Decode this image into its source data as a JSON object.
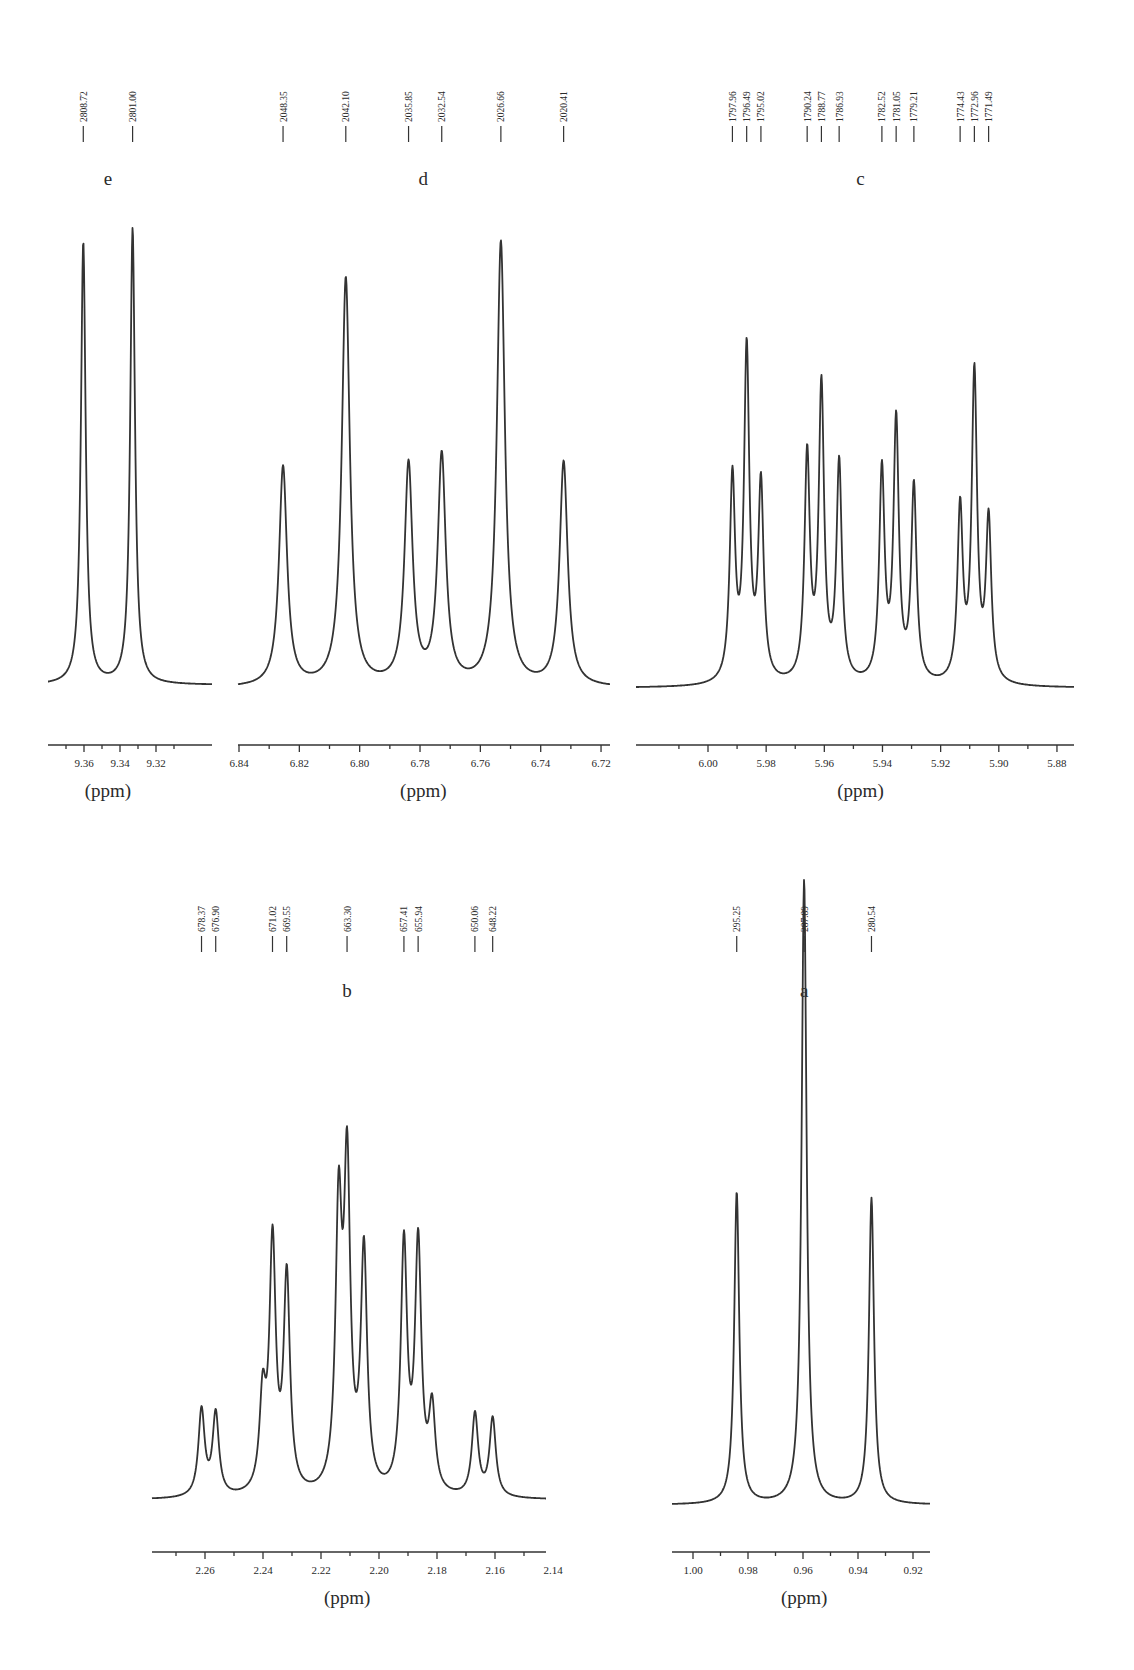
{
  "chart_data": [
    {
      "id": "e",
      "type": "line",
      "title": "e",
      "xlabel": "(ppm)",
      "ylabel": "",
      "xlim": [
        9.372,
        9.308
      ],
      "x_ticks_major": [
        9.36,
        9.34,
        9.32
      ],
      "tick_labels": [
        "9.36",
        "9.34",
        "9.32"
      ],
      "minor_tick_step": 0.01,
      "grid": false,
      "peak_labels_hz": [
        "2808.72",
        "2801.00"
      ],
      "peaks": [
        {
          "ppm": 9.3604,
          "rel_height": 0.97
        },
        {
          "ppm": 9.333,
          "rel_height": 1.0
        }
      ],
      "linewidth_ppm": 0.0032,
      "layout": {
        "x0": 48,
        "x1": 212,
        "axis_y": 745,
        "base_y": 685,
        "top_y": 228,
        "px_per_ppm": 1800,
        "ref_ppm": 9.36,
        "ref_px": 84,
        "label_y": 185,
        "marks_y": [
          60,
          128
        ]
      }
    },
    {
      "id": "d",
      "type": "line",
      "title": "d",
      "xlabel": "(ppm)",
      "ylabel": "",
      "xlim": [
        6.845,
        6.716
      ],
      "x_ticks_major": [
        6.84,
        6.82,
        6.8,
        6.78,
        6.76,
        6.74,
        6.72
      ],
      "tick_labels": [
        "6.84",
        "6.82",
        "6.80",
        "6.78",
        "6.76",
        "6.74",
        "6.72"
      ],
      "minor_tick_step": 0.01,
      "grid": false,
      "peak_labels_hz": [
        "2048.35",
        "2042.10",
        "2035.85",
        "2032.54",
        "2026.66",
        "2020.41"
      ],
      "peaks": [
        {
          "ppm": 6.8254,
          "rel_height": 0.49
        },
        {
          "ppm": 6.8046,
          "rel_height": 0.91
        },
        {
          "ppm": 6.7838,
          "rel_height": 0.49
        },
        {
          "ppm": 6.7728,
          "rel_height": 0.51
        },
        {
          "ppm": 6.7532,
          "rel_height": 0.99
        },
        {
          "ppm": 6.7324,
          "rel_height": 0.5
        }
      ],
      "linewidth_ppm": 0.0032,
      "layout": {
        "x0": 238,
        "x1": 610,
        "axis_y": 745,
        "base_y": 688,
        "top_y": 236,
        "px_per_ppm": 3017,
        "ref_ppm": 6.84,
        "ref_px": 239,
        "label_y": 185,
        "marks_y": [
          60,
          128
        ]
      }
    },
    {
      "id": "c",
      "type": "line",
      "title": "c",
      "xlabel": "(ppm)",
      "ylabel": "",
      "xlim": [
        6.012,
        5.873
      ],
      "x_ticks_major": [
        6.0,
        5.98,
        5.96,
        5.94,
        5.92,
        5.9,
        5.88
      ],
      "tick_labels": [
        "6.00",
        "5.98",
        "5.96",
        "5.94",
        "5.92",
        "5.90",
        "5.88"
      ],
      "minor_tick_step": 0.01,
      "grid": false,
      "peak_labels_hz": [
        "1797.96",
        "1796.49",
        "1795.02",
        "1790.24",
        "1788.77",
        "1786.93",
        "1782.52",
        "1781.05",
        "1779.21",
        "1774.43",
        "1772.96",
        "1771.49"
      ],
      "peaks": [
        {
          "ppm": 5.9916,
          "rel_height": 0.54
        },
        {
          "ppm": 5.9867,
          "rel_height": 0.88
        },
        {
          "ppm": 5.9818,
          "rel_height": 0.52
        },
        {
          "ppm": 5.9659,
          "rel_height": 0.6
        },
        {
          "ppm": 5.961,
          "rel_height": 0.78
        },
        {
          "ppm": 5.9549,
          "rel_height": 0.58
        },
        {
          "ppm": 5.9402,
          "rel_height": 0.56
        },
        {
          "ppm": 5.9353,
          "rel_height": 0.69
        },
        {
          "ppm": 5.9292,
          "rel_height": 0.52
        },
        {
          "ppm": 5.9133,
          "rel_height": 0.46
        },
        {
          "ppm": 5.9084,
          "rel_height": 0.82
        },
        {
          "ppm": 5.9035,
          "rel_height": 0.43
        }
      ],
      "linewidth_ppm": 0.0022,
      "layout": {
        "x0": 636,
        "x1": 1074,
        "axis_y": 745,
        "base_y": 688,
        "top_y": 290,
        "px_per_ppm": 2908,
        "ref_ppm": 6.0,
        "ref_px": 708,
        "label_y": 185,
        "marks_y": [
          60,
          128
        ]
      }
    },
    {
      "id": "b",
      "type": "line",
      "title": "b",
      "xlabel": "(ppm)",
      "ylabel": "",
      "xlim": [
        2.275,
        2.135
      ],
      "x_ticks_major": [
        2.26,
        2.24,
        2.22,
        2.2,
        2.18,
        2.16,
        2.14
      ],
      "tick_labels": [
        "2.26",
        "2.24",
        "2.22",
        "2.20",
        "2.18",
        "2.16",
        "2.14"
      ],
      "minor_tick_step": 0.01,
      "grid": false,
      "peak_labels_hz": [
        "678.37",
        "676.90",
        "671.02",
        "669.55",
        "663.30",
        "657.41",
        "655.94",
        "650.06",
        "648.22"
      ],
      "peaks": [
        {
          "ppm": 2.2612,
          "rel_height": 0.21
        },
        {
          "ppm": 2.2563,
          "rel_height": 0.2
        },
        {
          "ppm": 2.2401,
          "rel_height": 0.22
        },
        {
          "ppm": 2.2367,
          "rel_height": 0.6
        },
        {
          "ppm": 2.2318,
          "rel_height": 0.52
        },
        {
          "ppm": 2.2139,
          "rel_height": 0.66
        },
        {
          "ppm": 2.211,
          "rel_height": 0.76
        },
        {
          "ppm": 2.2052,
          "rel_height": 0.58
        },
        {
          "ppm": 2.1914,
          "rel_height": 0.6
        },
        {
          "ppm": 2.1865,
          "rel_height": 0.6
        },
        {
          "ppm": 2.1817,
          "rel_height": 0.2
        },
        {
          "ppm": 2.1669,
          "rel_height": 0.2
        },
        {
          "ppm": 2.1608,
          "rel_height": 0.19
        }
      ],
      "linewidth_ppm": 0.0026,
      "layout": {
        "x0": 152,
        "x1": 546,
        "axis_y": 1552,
        "base_y": 1500,
        "top_y": 1008,
        "px_per_ppm": 2900,
        "ref_ppm": 2.26,
        "ref_px": 205,
        "label_y": 997,
        "marks_y": [
          860,
          938
        ]
      }
    },
    {
      "id": "a",
      "type": "line",
      "title": "a",
      "xlabel": "(ppm)",
      "ylabel": "",
      "xlim": [
        1.008,
        0.912
      ],
      "x_ticks_major": [
        1.0,
        0.98,
        0.96,
        0.94,
        0.92
      ],
      "tick_labels": [
        "1.00",
        "0.98",
        "0.96",
        "0.94",
        "0.92"
      ],
      "minor_tick_step": 0.01,
      "grid": false,
      "peak_labels_hz": [
        "295.25",
        "287.89",
        "280.54"
      ],
      "peaks": [
        {
          "ppm": 0.9841,
          "rel_height": 0.5
        },
        {
          "ppm": 0.9596,
          "rel_height": 1.0
        },
        {
          "ppm": 0.9351,
          "rel_height": 0.49
        }
      ],
      "linewidth_ppm": 0.0022,
      "layout": {
        "x0": 672,
        "x1": 930,
        "axis_y": 1552,
        "base_y": 1505,
        "top_y": 880,
        "px_per_ppm": 2750,
        "ref_ppm": 1.0,
        "ref_px": 693,
        "label_y": 997,
        "marks_y": [
          860,
          938
        ]
      }
    }
  ],
  "labels": {
    "unit": "(ppm)",
    "panels": [
      "e",
      "d",
      "c",
      "b",
      "a"
    ]
  }
}
